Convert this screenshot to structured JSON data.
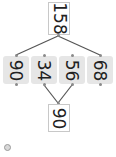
{
  "diagram": {
    "type": "number-bond",
    "orientation": "rotated-90",
    "top": {
      "value": "158"
    },
    "cells": [
      {
        "value": "90"
      },
      {
        "value": "34"
      },
      {
        "value": "56"
      },
      {
        "value": "68"
      }
    ],
    "bottom": {
      "value": "90"
    },
    "colors": {
      "line": "#555555",
      "cell_bg": "#e6e6e6",
      "box_border": "#c8c8c8"
    }
  },
  "footer": {
    "icon": "settings-icon"
  }
}
